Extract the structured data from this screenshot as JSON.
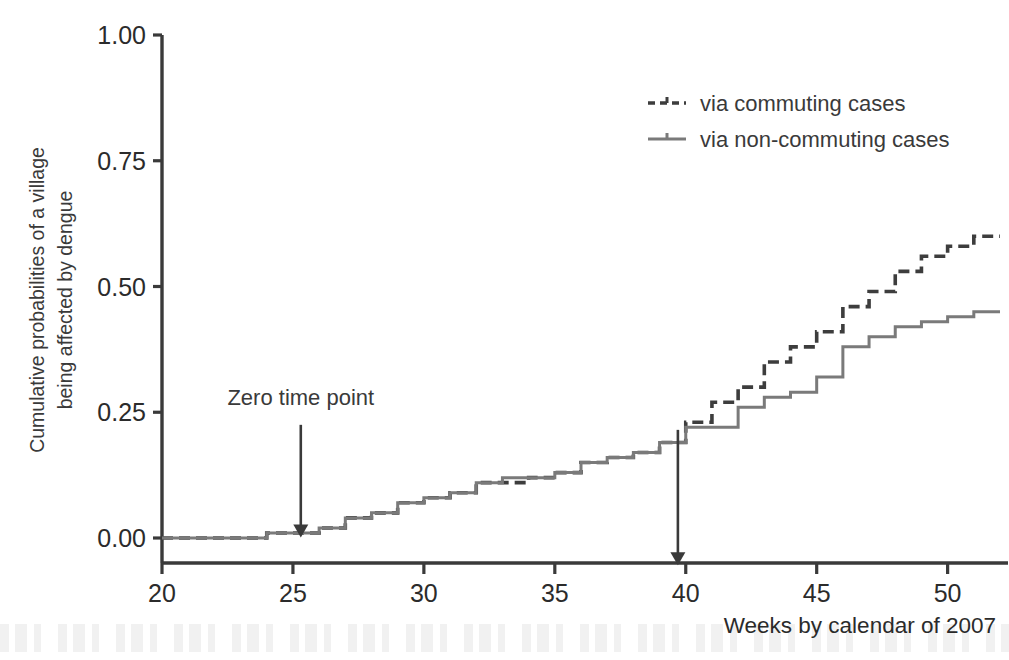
{
  "chart_data": {
    "type": "line",
    "subtype": "step",
    "title": "",
    "xlabel": "Weeks by calendar of 2007",
    "ylabel": "Cumulative probabilities of a village being affected by dengue",
    "ylabel_line1": "Cumulative probabilities of a village",
    "ylabel_line2": "being affected by dengue",
    "xlim": [
      20,
      52
    ],
    "ylim": [
      0.0,
      1.0
    ],
    "xticks": [
      20,
      25,
      30,
      35,
      40,
      45,
      50
    ],
    "xtick_labels": [
      "20",
      "25",
      "30",
      "35",
      "40",
      "45",
      "50"
    ],
    "yticks": [
      0.0,
      0.25,
      0.5,
      0.75,
      1.0
    ],
    "ytick_labels": [
      "0.00",
      "0.25",
      "0.50",
      "0.75",
      "1.00"
    ],
    "grid": false,
    "legend_position": "top-right",
    "series": [
      {
        "name": "via commuting cases",
        "style": "dashed",
        "color": "#3d3d3d",
        "x": [
          20,
          21,
          22,
          23,
          24,
          25,
          26,
          27,
          28,
          29,
          30,
          31,
          32,
          33,
          34,
          35,
          36,
          37,
          38,
          39,
          40,
          41,
          42,
          43,
          44,
          45,
          46,
          47,
          48,
          49,
          50,
          51,
          52
        ],
        "values": [
          0.0,
          0.0,
          0.0,
          0.0,
          0.01,
          0.01,
          0.02,
          0.04,
          0.05,
          0.07,
          0.08,
          0.09,
          0.11,
          0.11,
          0.12,
          0.13,
          0.15,
          0.16,
          0.17,
          0.19,
          0.23,
          0.27,
          0.3,
          0.35,
          0.38,
          0.41,
          0.46,
          0.49,
          0.53,
          0.56,
          0.58,
          0.6,
          0.6
        ]
      },
      {
        "name": "via non-commuting cases",
        "style": "solid",
        "color": "#7a7a7a",
        "x": [
          20,
          21,
          22,
          23,
          24,
          25,
          26,
          27,
          28,
          29,
          30,
          31,
          32,
          33,
          34,
          35,
          36,
          37,
          38,
          39,
          40,
          41,
          42,
          43,
          44,
          45,
          46,
          47,
          48,
          49,
          50,
          51,
          52
        ],
        "values": [
          0.0,
          0.0,
          0.0,
          0.0,
          0.01,
          0.01,
          0.02,
          0.04,
          0.05,
          0.07,
          0.08,
          0.09,
          0.11,
          0.12,
          0.12,
          0.13,
          0.15,
          0.16,
          0.17,
          0.19,
          0.22,
          0.22,
          0.26,
          0.28,
          0.29,
          0.32,
          0.38,
          0.4,
          0.42,
          0.43,
          0.44,
          0.45,
          0.45
        ]
      }
    ],
    "annotations": [
      {
        "text": "Zero time point",
        "arrow_x": 25.3,
        "arrow_from_y": 0.225,
        "arrow_to_y": 0.005,
        "label_x": 25.3,
        "label_y": 0.265
      },
      {
        "text": "",
        "arrow_x": 39.7,
        "arrow_from_y": 0.215,
        "arrow_to_y": -0.05,
        "label_x": 39.7,
        "label_y": 0.0
      }
    ]
  },
  "legend": {
    "items": [
      {
        "label": "via commuting cases",
        "style": "dashed",
        "color": "#3d3d3d"
      },
      {
        "label": "via non-commuting cases",
        "style": "solid",
        "color": "#7a7a7a"
      }
    ]
  },
  "axes": {
    "x_title": "Weeks by calendar of 2007",
    "y_title_line1": "Cumulative probabilities of a village",
    "y_title_line2": "being affected by dengue"
  },
  "annotation_labels": {
    "zero_time_point": "Zero time point"
  },
  "colors": {
    "axis": "#3a3a3a",
    "commuting": "#3d3d3d",
    "non_commuting": "#7a7a7a",
    "text": "#2b2b2b",
    "background": "#ffffff"
  }
}
